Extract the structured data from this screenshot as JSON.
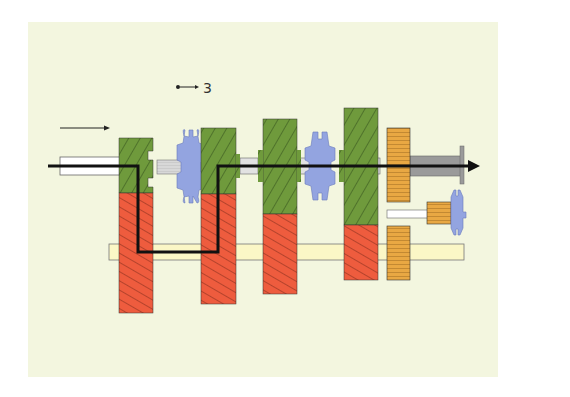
{
  "diagram": {
    "gear_label": "3",
    "colors": {
      "background": "#f3f6df",
      "main_shaft_gear": "#6f9a3c",
      "countershaft_gear": "#ee5c3e",
      "synchronizer": "#93a4e0",
      "reverse_gear": "#e9a843",
      "countershaft": "#fbf7c6",
      "power_flow_line": "#111111",
      "output_shaft": "#9a9a9a"
    },
    "components": [
      {
        "name": "input-shaft"
      },
      {
        "name": "input-gear-pair"
      },
      {
        "name": "synchronizer-3-4"
      },
      {
        "name": "third-gear-pair"
      },
      {
        "name": "second-gear-pair"
      },
      {
        "name": "synchronizer-1-2"
      },
      {
        "name": "first-gear-pair"
      },
      {
        "name": "reverse-gears"
      },
      {
        "name": "reverse-idler"
      },
      {
        "name": "countershaft"
      },
      {
        "name": "output-shaft"
      }
    ]
  }
}
